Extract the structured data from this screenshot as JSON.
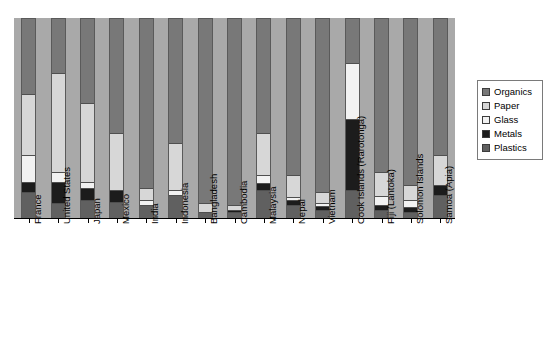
{
  "chart_data": {
    "type": "bar",
    "subtype": "stacked-bar-100percent",
    "title": "",
    "xlabel": "",
    "ylabel": "",
    "ylim": [
      0,
      100
    ],
    "grid": false,
    "legend_position": "right",
    "categories": [
      "France",
      "United States",
      "Japan",
      "Mexico",
      "India",
      "Indonesia",
      "Bangladesh",
      "Cambodia",
      "Malaysia",
      "Nepal",
      "Vietnam",
      "Cook Islands (Rarotonga)",
      "Fiji (Lantoka)",
      "Solomon Islands",
      "Samoa (Apia)"
    ],
    "series": [
      {
        "name": "Organics",
        "color": "#787878",
        "values": [
          37.5,
          27.0,
          42.0,
          57.5,
          85.0,
          62.5,
          92.5,
          93.5,
          57.5,
          78.5,
          87.0,
          22.0,
          77.0,
          83.5,
          68.5
        ]
      },
      {
        "name": "Paper",
        "color": "#d7d7d7",
        "values": [
          31.0,
          50.0,
          40.0,
          28.5,
          6.0,
          23.5,
          4.5,
          2.5,
          21.0,
          11.0,
          5.5,
          0.0,
          12.0,
          7.5,
          15.0
        ]
      },
      {
        "name": "Glass",
        "color": "#f2f2f2",
        "values": [
          13.5,
          5.0,
          3.0,
          0.0,
          2.5,
          2.5,
          0.0,
          0.0,
          4.0,
          1.5,
          1.5,
          28.0,
          4.5,
          3.5,
          0.0
        ]
      },
      {
        "name": "Metals",
        "color": "#1c1c1c",
        "values": [
          5.0,
          10.5,
          6.0,
          6.0,
          0.0,
          0.0,
          0.0,
          1.0,
          3.5,
          2.5,
          2.0,
          36.0,
          2.5,
          2.5,
          5.0
        ]
      },
      {
        "name": "Plastics",
        "color": "#606060",
        "values": [
          13.0,
          7.5,
          9.0,
          8.0,
          6.5,
          11.5,
          3.0,
          3.0,
          14.0,
          6.5,
          4.0,
          14.0,
          4.0,
          3.0,
          11.5
        ]
      }
    ]
  },
  "legend": {
    "items": [
      {
        "label": "Organics",
        "color": "#787878"
      },
      {
        "label": "Paper",
        "color": "#d7d7d7"
      },
      {
        "label": "Glass",
        "color": "#f2f2f2"
      },
      {
        "label": "Metals",
        "color": "#1c1c1c"
      },
      {
        "label": "Plastics",
        "color": "#606060"
      }
    ]
  },
  "panel": {
    "background_color": "#a9a9a9",
    "axis_color": "#000000",
    "page_background": "#ffffff"
  }
}
